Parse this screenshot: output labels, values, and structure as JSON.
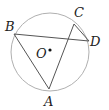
{
  "diagram": {
    "type": "circle-geometry",
    "circle": {
      "center_label": "O",
      "cx": 50,
      "cy": 52,
      "r": 39,
      "stroke": "#aaaaaa"
    },
    "points": [
      {
        "label": "A",
        "x": 49,
        "y": 89,
        "label_x": 44,
        "label_y": 106
      },
      {
        "label": "B",
        "x": 14,
        "y": 34,
        "label_x": 5,
        "label_y": 31
      },
      {
        "label": "C",
        "x": 74,
        "y": 24,
        "label_x": 74,
        "label_y": 17
      },
      {
        "label": "D",
        "x": 89,
        "y": 41,
        "label_x": 90,
        "label_y": 46
      }
    ],
    "center_point": {
      "label": "O",
      "x": 50,
      "y": 50,
      "label_x": 36,
      "label_y": 58
    },
    "segments": [
      "AB",
      "AC",
      "BD",
      "CD"
    ],
    "line_color": "#555555"
  }
}
